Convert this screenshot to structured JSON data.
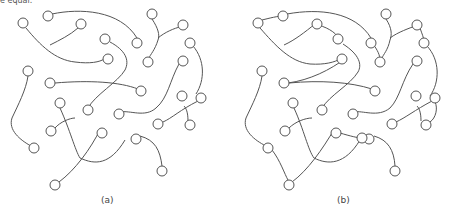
{
  "header_fragment": "e equal.",
  "panels": [
    {
      "label": "(a)",
      "nodes": [
        [
          23,
          23
        ],
        [
          48,
          16
        ],
        [
          81,
          24
        ],
        [
          105,
          39
        ],
        [
          108,
          59
        ],
        [
          137,
          43
        ],
        [
          152,
          14
        ],
        [
          183,
          25
        ],
        [
          190,
          43
        ],
        [
          148,
          62
        ],
        [
          183,
          61
        ],
        [
          28,
          71
        ],
        [
          50,
          83
        ],
        [
          141,
          91
        ],
        [
          182,
          96
        ],
        [
          201,
          98
        ],
        [
          60,
          103
        ],
        [
          88,
          110
        ],
        [
          119,
          114
        ],
        [
          158,
          124
        ],
        [
          190,
          125
        ],
        [
          51,
          131
        ],
        [
          102,
          133
        ],
        [
          34,
          148
        ],
        [
          136,
          139
        ],
        [
          128,
          138
        ],
        [
          162,
          171
        ],
        [
          55,
          185
        ]
      ]
    },
    {
      "label": "(b)",
      "nodes": [
        [
          258,
          23
        ],
        [
          283,
          16
        ],
        [
          317,
          24
        ],
        [
          338,
          39
        ],
        [
          342,
          59
        ],
        [
          371,
          43
        ],
        [
          386,
          14
        ],
        [
          417,
          25
        ],
        [
          424,
          43
        ],
        [
          380,
          62
        ],
        [
          417,
          61
        ],
        [
          262,
          71
        ],
        [
          284,
          83
        ],
        [
          375,
          91
        ],
        [
          416,
          96
        ],
        [
          435,
          98
        ],
        [
          293,
          103
        ],
        [
          322,
          110
        ],
        [
          353,
          114
        ],
        [
          392,
          124
        ],
        [
          426,
          125
        ],
        [
          285,
          131
        ],
        [
          336,
          133
        ],
        [
          268,
          148
        ],
        [
          369,
          139
        ],
        [
          362,
          138
        ],
        [
          395,
          171
        ],
        [
          289,
          185
        ]
      ]
    }
  ]
}
